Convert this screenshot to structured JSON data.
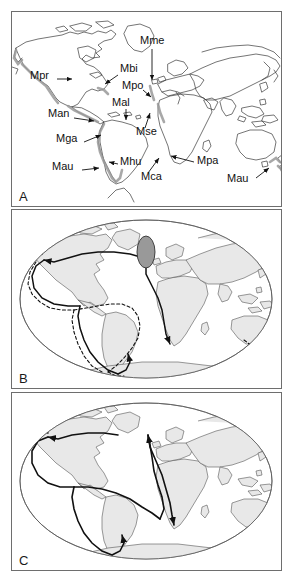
{
  "figure": {
    "panels": [
      {
        "id": "A",
        "letter": "A",
        "type": "world-map-outline",
        "description": "World map outline with shaded coastal distributions and leader-line labels for Mytilus taxa",
        "labels": [
          {
            "text": "Mpr",
            "x": 18,
            "y": 64,
            "leader": {
              "x1": 45,
              "y1": 67,
              "x2": 62,
              "y2": 67
            }
          },
          {
            "text": "Mbi",
            "x": 108,
            "y": 57,
            "leader": {
              "x1": 106,
              "y1": 63,
              "x2": 92,
              "y2": 73
            }
          },
          {
            "text": "Mme",
            "x": 128,
            "y": 29,
            "leader": {
              "x1": 140,
              "y1": 37,
              "x2": 140,
              "y2": 70
            }
          },
          {
            "text": "Mpo",
            "x": 110,
            "y": 74,
            "leader": {
              "x1": 131,
              "y1": 78,
              "x2": 140,
              "y2": 86
            }
          },
          {
            "text": "Mal",
            "x": 100,
            "y": 91,
            "leader": {
              "x1": 114,
              "y1": 97,
              "x2": 114,
              "y2": 110
            }
          },
          {
            "text": "Man",
            "x": 38,
            "y": 102,
            "leader": {
              "x1": 62,
              "y1": 106,
              "x2": 84,
              "y2": 109
            }
          },
          {
            "text": "Mse",
            "x": 124,
            "y": 120,
            "leader": {
              "x1": 133,
              "y1": 116,
              "x2": 138,
              "y2": 100
            }
          },
          {
            "text": "Mga",
            "x": 46,
            "y": 127,
            "leader": {
              "x1": 72,
              "y1": 130,
              "x2": 90,
              "y2": 123
            }
          },
          {
            "text": "Mhu",
            "x": 108,
            "y": 150,
            "leader": {
              "x1": 106,
              "y1": 152,
              "x2": 96,
              "y2": 150
            }
          },
          {
            "text": "Mau",
            "x": 42,
            "y": 155,
            "leader": {
              "x1": 70,
              "y1": 158,
              "x2": 88,
              "y2": 156
            }
          },
          {
            "text": "Mca",
            "x": 130,
            "y": 165,
            "leader": {
              "x1": 136,
              "y1": 161,
              "x2": 148,
              "y2": 145
            }
          },
          {
            "text": "Mpa",
            "x": 185,
            "y": 149,
            "leader": {
              "x1": 182,
              "y1": 150,
              "x2": 158,
              "y2": 144
            }
          },
          {
            "text": "Mau",
            "x": 216,
            "y": 167,
            "leader": {
              "x1": 244,
              "y1": 166,
              "x2": 258,
              "y2": 155
            }
          }
        ]
      },
      {
        "id": "B",
        "letter": "B",
        "type": "mollweide-dispersal-map",
        "description": "Mollweide world map with shaded continents, hatched ancestral-area ellipse in North Atlantic, and solid plus dashed dispersal routes with arrowheads"
      },
      {
        "id": "C",
        "letter": "C",
        "type": "mollweide-dispersal-map",
        "description": "Mollweide world map with shaded continents and solid dispersal routes with arrowheads"
      }
    ]
  },
  "colors": {
    "frame": "#6e6e6e",
    "coastline": "#3a3a3a",
    "land_fill": "#e6e6e6",
    "shaded_coast": "#9a9a9a",
    "route": "#111111",
    "label_text": "#111111",
    "background": "#ffffff"
  }
}
